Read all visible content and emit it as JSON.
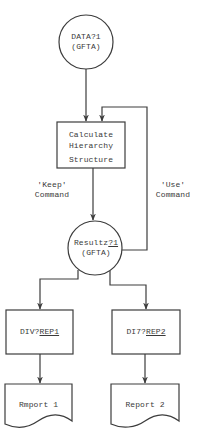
{
  "diagram": {
    "type": "flowchart",
    "nodes": {
      "data_file": {
        "shape": "circle",
        "line1": "DATA?1",
        "line2": "(GFTA)"
      },
      "process": {
        "shape": "rectangle",
        "line1": "Calculate",
        "line2": "Hierarchy",
        "line3": "Structure"
      },
      "results_file": {
        "shape": "circle",
        "line1_prefix": "Resultz",
        "line1_suffix": "?1",
        "line2": "(GFTA)"
      },
      "report_proc_1": {
        "shape": "rectangle",
        "prefix": "DIV?",
        "suffix": "REP1"
      },
      "report_proc_2": {
        "shape": "rectangle",
        "prefix": "DI7?",
        "suffix": "REP2"
      },
      "report_1": {
        "shape": "document",
        "label": "Rmport 1"
      },
      "report_2": {
        "shape": "document",
        "label": "Report 2"
      }
    },
    "edge_labels": {
      "keep": {
        "line1": "'Keep'",
        "line2": "Command"
      },
      "use": {
        "line1": "'Use'",
        "line2": "Command"
      }
    },
    "edges": [
      {
        "from": "data_file",
        "to": "process"
      },
      {
        "from": "process",
        "to": "results_file",
        "label": "keep"
      },
      {
        "from": "results_file",
        "to": "process",
        "label": "use"
      },
      {
        "from": "results_file",
        "to": "report_proc_1"
      },
      {
        "from": "results_file",
        "to": "report_proc_2"
      },
      {
        "from": "report_proc_1",
        "to": "report_1"
      },
      {
        "from": "report_proc_2",
        "to": "report_2"
      }
    ]
  }
}
